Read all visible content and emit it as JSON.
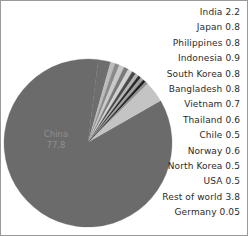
{
  "chart_data": {
    "type": "pie",
    "title": "",
    "unit_note": "",
    "legend_position": "right",
    "grid": false,
    "center": {
      "cx": 87,
      "cy": 142,
      "r": 84
    },
    "start_angle_deg": -83,
    "inside_labels": [
      {
        "name": "China",
        "value_text": "77.8",
        "x": 55,
        "y": 136,
        "color": "#6b6b6b"
      }
    ],
    "categories": [
      "India",
      "Japan",
      "Philippines",
      "Indonesia",
      "South Korea",
      "Bangladesh",
      "Vietnam",
      "Thailand",
      "Chile",
      "Norway",
      "North Korea",
      "USA",
      "Rest of world",
      "Germany",
      "China"
    ],
    "values": [
      2.2,
      0.8,
      0.8,
      0.9,
      0.8,
      0.8,
      0.7,
      0.6,
      0.5,
      0.6,
      0.5,
      0.5,
      3.8,
      0.05,
      77.8
    ],
    "slice_colors": [
      "#6e6e6e",
      "#bcbcbc",
      "#8a8a8a",
      "#c9c9c9",
      "#7a7a7a",
      "#d2d2d2",
      "#4a4a4a",
      "#b4b4b4",
      "#2a2a2a",
      "#a0a0a0",
      "#1e1e1e",
      "#8f8f8f",
      "#c4c4c4",
      "#202020",
      "#6b6b6b"
    ],
    "slices": [
      {
        "name": "India",
        "value": 2.2,
        "color": "#6e6e6e"
      },
      {
        "name": "Japan",
        "value": 0.8,
        "color": "#bcbcbc"
      },
      {
        "name": "Philippines",
        "value": 0.8,
        "color": "#8a8a8a"
      },
      {
        "name": "Indonesia",
        "value": 0.9,
        "color": "#c9c9c9"
      },
      {
        "name": "South Korea",
        "value": 0.8,
        "color": "#7a7a7a"
      },
      {
        "name": "Bangladesh",
        "value": 0.8,
        "color": "#d2d2d2"
      },
      {
        "name": "Vietnam",
        "value": 0.7,
        "color": "#4a4a4a"
      },
      {
        "name": "Thailand",
        "value": 0.6,
        "color": "#b4b4b4"
      },
      {
        "name": "Chile",
        "value": 0.5,
        "color": "#2a2a2a"
      },
      {
        "name": "Norway",
        "value": 0.6,
        "color": "#a0a0a0"
      },
      {
        "name": "North Korea",
        "value": 0.5,
        "color": "#1e1e1e"
      },
      {
        "name": "USA",
        "value": 0.5,
        "color": "#8f8f8f"
      },
      {
        "name": "Rest of world",
        "value": 3.8,
        "color": "#c4c4c4"
      },
      {
        "name": "Germany",
        "value": 0.05,
        "color": "#202020"
      },
      {
        "name": "China",
        "value": 77.8,
        "color": "#6b6b6b"
      }
    ]
  },
  "legend": {
    "items": [
      {
        "label": "India 2.2"
      },
      {
        "label": "Japan 0.8"
      },
      {
        "label": "Philippines 0.8"
      },
      {
        "label": "Indonesia 0.9"
      },
      {
        "label": "South Korea 0.8"
      },
      {
        "label": "Bangladesh 0.8"
      },
      {
        "label": "Vietnam 0.7"
      },
      {
        "label": "Thailand 0.6"
      },
      {
        "label": "Chile 0.5"
      },
      {
        "label": "Norway 0.6"
      },
      {
        "label": "North Korea 0.5"
      },
      {
        "label": "USA 0.5"
      },
      {
        "label": "Rest of world 3.8"
      },
      {
        "label": "Germany 0.05"
      }
    ]
  }
}
